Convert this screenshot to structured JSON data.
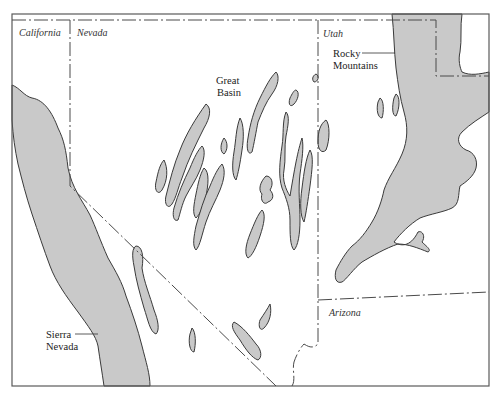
{
  "map": {
    "type": "physiographic-sketch-map",
    "region": "Great Basin and surrounding mountains",
    "colors": {
      "mountain_fill": "#c9c9c9",
      "outline": "#3a3a3a",
      "background": "#ffffff"
    },
    "state_labels": {
      "california": "California",
      "nevada": "Nevada",
      "utah": "Utah",
      "arizona": "Arizona"
    },
    "feature_labels": {
      "great_basin_line1": "Great",
      "great_basin_line2": "Basin",
      "rocky_line1": "Rocky",
      "rocky_line2": "Mountains",
      "sierra_line1": "Sierra",
      "sierra_line2": "Nevada"
    },
    "legend": {
      "shaded": "Mountain ranges"
    }
  }
}
